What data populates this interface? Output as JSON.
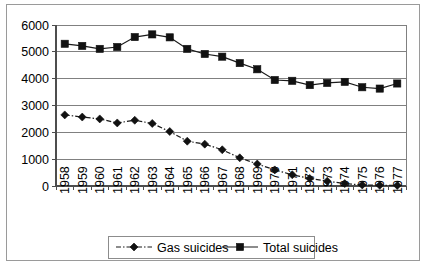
{
  "chart_data": {
    "type": "line",
    "title": "",
    "subtitle": "",
    "xlabel": "",
    "ylabel": "",
    "categories": [
      "1958",
      "1959",
      "1960",
      "1961",
      "1962",
      "1963",
      "1964",
      "1965",
      "1966",
      "1967",
      "1968",
      "1969",
      "1970",
      "1971",
      "1972",
      "1973",
      "1974",
      "1975",
      "1976",
      "1977"
    ],
    "series": [
      {
        "name": "Gas suicides",
        "marker": "diamond",
        "line_style": "dash-dot",
        "color": "#111111",
        "values": [
          2650,
          2570,
          2500,
          2350,
          2450,
          2330,
          2030,
          1670,
          1560,
          1350,
          1050,
          820,
          600,
          420,
          280,
          180,
          90,
          40,
          25,
          20
        ]
      },
      {
        "name": "Total suicides",
        "marker": "square",
        "line_style": "solid",
        "color": "#111111",
        "values": [
          5300,
          5220,
          5110,
          5180,
          5550,
          5650,
          5540,
          5110,
          4920,
          4820,
          4580,
          4350,
          3950,
          3920,
          3760,
          3840,
          3880,
          3680,
          3630,
          3820
        ]
      }
    ],
    "ylim": [
      0,
      6000
    ],
    "yticks": [
      0,
      1000,
      2000,
      3000,
      4000,
      5000,
      6000
    ],
    "ytick_labels": [
      "0",
      "1000",
      "2000",
      "3000",
      "4000",
      "5000",
      "6000"
    ],
    "grid": "horizontal",
    "legend_position": "bottom",
    "legend_entries": [
      "Gas suicides",
      "Total suicides"
    ]
  },
  "axes": {
    "y_axis_name": "y-axis",
    "x_axis_name": "x-axis"
  }
}
